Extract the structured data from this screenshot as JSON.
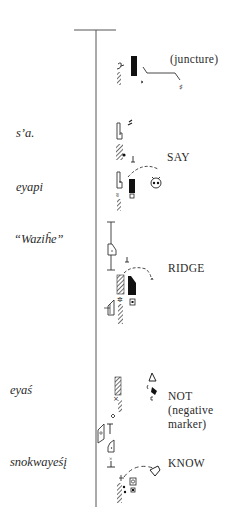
{
  "figure": {
    "type": "movement notation staff (transcription of signed/spoken text)",
    "staff": {
      "top_bar": true,
      "x": 96,
      "y_top": 30,
      "y_bottom": 507
    }
  },
  "left_labels": [
    {
      "id": "sa",
      "text": "s’a.",
      "y": 134
    },
    {
      "id": "eyapi",
      "text": "eyapi",
      "y": 188
    },
    {
      "id": "wazihe",
      "text": "“Waziĥe”",
      "y": 240
    },
    {
      "id": "eyas",
      "text": "eyaś",
      "y": 391
    },
    {
      "id": "snokwayesi",
      "text": "snokwayeśį",
      "y": 463
    }
  ],
  "right_labels": [
    {
      "id": "juncture",
      "lines": [
        "(juncture)"
      ],
      "y": 53
    },
    {
      "id": "say",
      "lines": [
        "SAY"
      ],
      "y": 152
    },
    {
      "id": "ridge",
      "lines": [
        "RIDGE"
      ],
      "y": 260
    },
    {
      "id": "not",
      "lines": [
        "NOT",
        "(negative",
        "marker)"
      ],
      "y": 388
    },
    {
      "id": "know",
      "lines": [
        "KNOW"
      ],
      "y": 463
    }
  ],
  "symbols": [
    {
      "name": "juncture-group",
      "glyphs": [
        "hook",
        "black-bar",
        "hatched-wedge",
        "juncture-line",
        "sharp-sign"
      ]
    },
    {
      "name": "say-group",
      "glyphs": [
        "hand-shape",
        "hatched-wedge",
        "perpendicular-tick",
        "dashed-arc-path",
        "face-sign",
        "black-bar"
      ]
    },
    {
      "name": "ridge-group",
      "glyphs": [
        "I-beam",
        "hand-shape",
        "hatched-block",
        "black-wedge",
        "dashed-arc-path",
        "star"
      ]
    },
    {
      "name": "not-group",
      "glyphs": [
        "hatched-block",
        "triangle-sign",
        "diamond",
        "hatched-wedge",
        "palm-plane"
      ]
    },
    {
      "name": "know-group",
      "glyphs": [
        "hand-shape",
        "x-mark",
        "dashed-arc-path",
        "heart-arrow",
        "boxed-circle",
        "hatched-wedge"
      ]
    }
  ]
}
